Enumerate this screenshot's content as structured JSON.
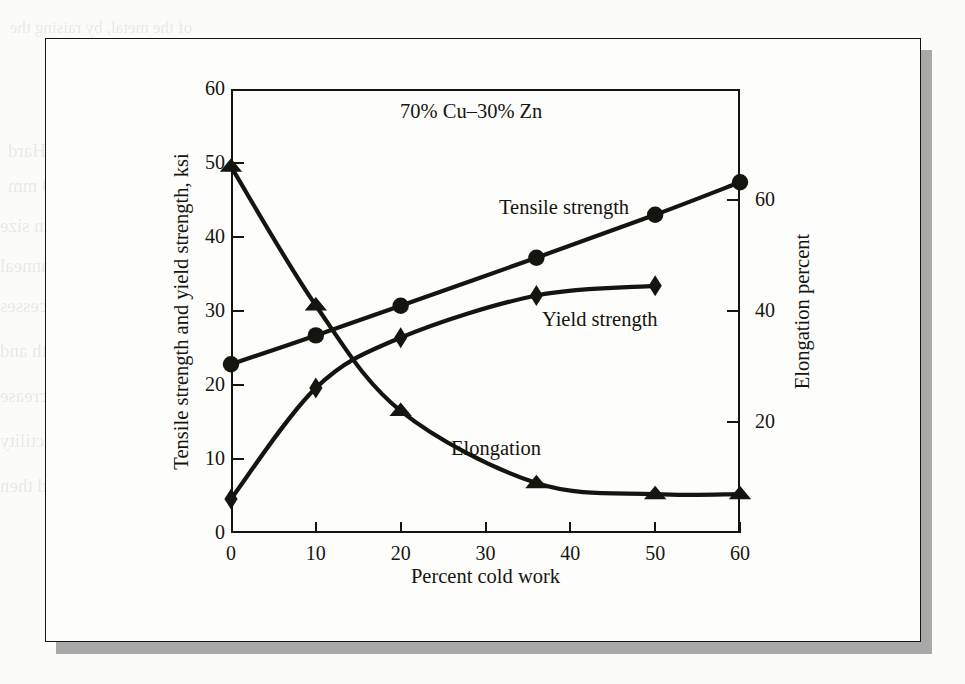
{
  "figure": {
    "title": "70% Cu–30% Zn",
    "x_axis_label": "Percent cold work",
    "y_axis_left_label": "Tensile strength and yield strength, ksi",
    "y_axis_right_label": "Elongation percent",
    "frame_color": "#15150f",
    "shadow_color": "#a9a9a9",
    "page_color": "#fbfbf9"
  },
  "series_labels": {
    "tensile": "Tensile strength",
    "yield": "Yield strength",
    "elongation": "Elongation"
  },
  "chart_data": {
    "type": "line",
    "title": "70% Cu–30% Zn",
    "xlabel": "Percent cold work",
    "ylabel": "Tensile strength and yield strength, ksi",
    "y2label": "Elongation percent",
    "xlim": [
      0,
      60
    ],
    "ylim": [
      0,
      60
    ],
    "y2lim": [
      0,
      80
    ],
    "xticks": [
      0,
      10,
      20,
      30,
      40,
      50,
      60
    ],
    "yticks": [
      0,
      10,
      20,
      30,
      40,
      50,
      60
    ],
    "y2ticks": [
      20,
      40,
      60
    ],
    "grid": false,
    "legend": "inline-annotations",
    "series": [
      {
        "name": "Tensile strength",
        "axis": "left",
        "marker": "circle",
        "units": "ksi",
        "x": [
          0,
          10,
          20,
          36,
          50,
          60
        ],
        "values": [
          22.8,
          26.7,
          30.7,
          37.2,
          43.0,
          47.4
        ]
      },
      {
        "name": "Yield strength",
        "axis": "left",
        "marker": "diamond",
        "units": "ksi",
        "x": [
          0,
          10,
          20,
          36,
          50
        ],
        "values": [
          4.6,
          19.6,
          26.4,
          32.1,
          33.4
        ]
      },
      {
        "name": "Elongation",
        "axis": "right",
        "marker": "triangle",
        "units": "percent",
        "x": [
          0,
          10,
          20,
          36,
          50,
          60
        ],
        "values": [
          66,
          41,
          22,
          9,
          7,
          7
        ]
      }
    ]
  },
  "bleed_text": {
    "lines": [
      "of the metal, by raising the",
      "cold-worked metal at the",
      "recrystallization temperature",
      "1.1 Hard",
      "1.0 mm",
      "grain size",
      "the anneal",
      "processes",
      "strength and",
      "the increase",
      "ductility",
      "and then",
      "Cold work",
      "dislocations"
    ]
  }
}
